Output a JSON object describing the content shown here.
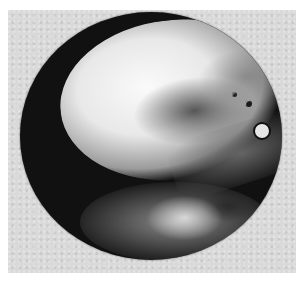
{
  "image": {
    "subject": "circular-specimen-photograph",
    "mode": "grayscale",
    "colors": {
      "page": "#ffffff",
      "background": "#d9d9d9",
      "disc_dark": "#111111",
      "highlight": "#fafafa"
    }
  }
}
